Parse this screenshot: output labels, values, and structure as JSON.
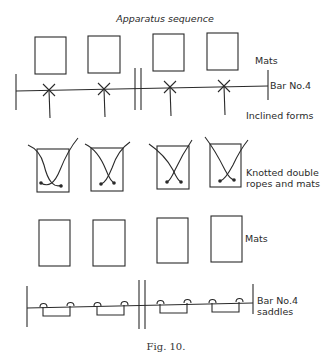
{
  "title": "Apparatus sequence",
  "caption": "Fig. 10.",
  "rows": [
    {
      "id": "mats-top",
      "label": "Mats"
    },
    {
      "id": "bar",
      "label": "Bar No.4"
    },
    {
      "id": "inclined",
      "label": "Inclined forms"
    },
    {
      "id": "ropes",
      "label_lines": [
        "Knotted double",
        "ropes and mats"
      ]
    },
    {
      "id": "mats-bottom",
      "label": "Mats"
    },
    {
      "id": "bar-saddles",
      "label_lines": [
        "Bar No.4",
        "saddles"
      ]
    }
  ]
}
